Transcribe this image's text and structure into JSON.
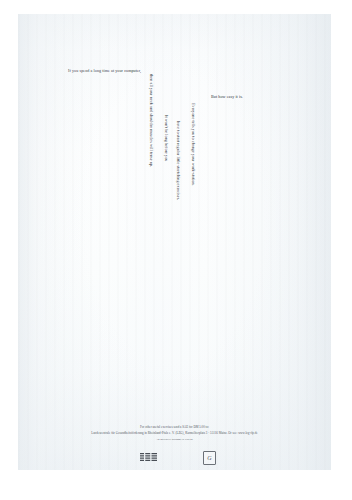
{
  "ad": {
    "headline": "If you spend a long time at your computer,",
    "body_lines": [
      "then all your neck and shoulder muscles will tense up.",
      "It won't be long before you",
      "have to start regular little stretching exercises.",
      "Everyone tells you to change your work-station."
    ],
    "closing": "But how easy it is."
  },
  "footer": {
    "lines": [
      "For other useful exercises send a SAE for DM 5.00 to:",
      "Landeszentrale für Gesundheitsförderung in Rheinland-Pfalz e. V. (LZG), Karmeliterplatz 3 · 55116 Mainz. Or see: www.lzg-rlp.de",
      "An initiative brought to you by"
    ]
  },
  "logos": {
    "brand": "IBM",
    "award_mark": "G"
  },
  "colors": {
    "ink": "#2b3038",
    "paper": "#fafcfd",
    "scan_edge": "#ecf0f3"
  }
}
